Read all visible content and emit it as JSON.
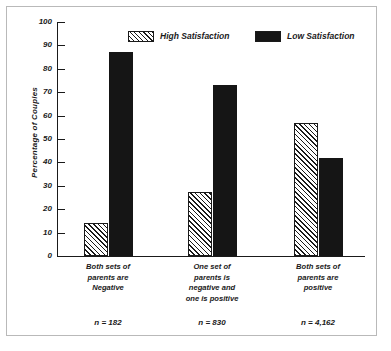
{
  "chart_data": {
    "type": "bar",
    "title": "",
    "xlabel": "",
    "ylabel": "Percentage of Couples",
    "ylim": [
      0,
      100
    ],
    "yticks": [
      0,
      10,
      20,
      30,
      40,
      50,
      60,
      70,
      80,
      90,
      100
    ],
    "grid": false,
    "legend_position": "top-center",
    "categories": [
      "Both sets of parents are Negative",
      "One set of parents is negative and one is positive",
      "Both sets of parents are positive"
    ],
    "category_lines": [
      [
        "Both sets of",
        "parents are",
        "Negative"
      ],
      [
        "One set of",
        "parents is",
        "negative and",
        "one is positive"
      ],
      [
        "Both sets of",
        "parents are",
        "positive"
      ]
    ],
    "annotations": [
      "n = 182",
      "n = 830",
      "n = 4,162"
    ],
    "series": [
      {
        "name": "High Satisfaction",
        "pattern": "diagonal-hatch",
        "color": "#1a1a1a",
        "values": [
          14,
          27.5,
          57
        ]
      },
      {
        "name": "Low Satisfaction",
        "pattern": "solid",
        "color": "#151515",
        "values": [
          87,
          73,
          42
        ]
      }
    ]
  },
  "legend": {
    "items": [
      {
        "label": "High Satisfaction",
        "swatch": "hatch-swatch"
      },
      {
        "label": "Low Satisfaction",
        "swatch": "solid-swatch"
      }
    ]
  },
  "axis": {
    "y_title": "Percentage of Couples",
    "tick_labels": [
      "100",
      "90",
      "80",
      "70",
      "60",
      "50",
      "40",
      "30",
      "20",
      "10",
      "0"
    ]
  }
}
